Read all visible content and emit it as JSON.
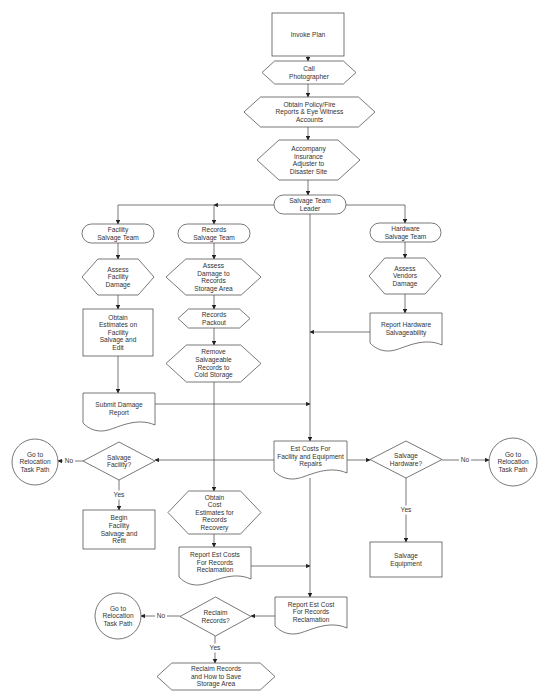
{
  "colors": {
    "stroke": "#555555",
    "fill": "#ffffff",
    "text": "#333333",
    "background": "#ffffff"
  },
  "nodes": [
    {
      "id": "invoke-plan",
      "shape": "rect",
      "x": 272,
      "y": 13,
      "w": 72,
      "h": 43,
      "lines": [
        "Invoke Plan"
      ]
    },
    {
      "id": "call-photographer",
      "shape": "hexagon",
      "x": 262,
      "y": 61,
      "w": 94,
      "h": 23,
      "lines": [
        "Call",
        "Photographer"
      ]
    },
    {
      "id": "obtain-policy",
      "shape": "hexagon",
      "x": 244,
      "y": 97,
      "w": 131,
      "h": 30,
      "lines": [
        "Obtain Policy/Fire",
        "Reports & Eye Witness",
        "Accounts"
      ]
    },
    {
      "id": "accompany-adjuster",
      "shape": "hexagon",
      "x": 257,
      "y": 140,
      "w": 103,
      "h": 40,
      "lines": [
        "Accompany",
        "Insurance",
        "Adjuster to",
        "Disaster Site"
      ]
    },
    {
      "id": "salvage-team-leader",
      "shape": "terminator",
      "x": 274,
      "y": 195,
      "w": 72,
      "h": 19,
      "lines": [
        "Salvage Team",
        "Leader"
      ]
    },
    {
      "id": "facility-salvage-team",
      "shape": "terminator",
      "x": 82,
      "y": 224,
      "w": 72,
      "h": 19,
      "lines": [
        "Facility",
        "Salvage Team"
      ]
    },
    {
      "id": "assess-facility-damage",
      "shape": "hexagon",
      "x": 82,
      "y": 259,
      "w": 72,
      "h": 36,
      "lines": [
        "Assess",
        "Facility",
        "Damage"
      ]
    },
    {
      "id": "obtain-estimates-facility",
      "shape": "rect",
      "x": 83,
      "y": 309,
      "w": 70,
      "h": 47,
      "lines": [
        "Obtain",
        "Estimates on",
        "Facility",
        "Salvage and",
        "Edit"
      ]
    },
    {
      "id": "submit-damage-report",
      "shape": "document",
      "x": 83,
      "y": 393,
      "w": 72,
      "h": 37,
      "lines": [
        "Submit Damage",
        "Report"
      ]
    },
    {
      "id": "records-salvage-team",
      "shape": "terminator",
      "x": 178,
      "y": 224,
      "w": 72,
      "h": 19,
      "lines": [
        "Records",
        "Salvage Team"
      ]
    },
    {
      "id": "assess-records-damage",
      "shape": "hexagon",
      "x": 166,
      "y": 259,
      "w": 95,
      "h": 36,
      "lines": [
        "Assess",
        "Damage to",
        "Records",
        "Storage Area"
      ]
    },
    {
      "id": "records-packout",
      "shape": "hexagon",
      "x": 178,
      "y": 309,
      "w": 72,
      "h": 19,
      "lines": [
        "Records",
        "Packout"
      ]
    },
    {
      "id": "remove-salvageable",
      "shape": "hexagon",
      "x": 166,
      "y": 345,
      "w": 95,
      "h": 37,
      "lines": [
        "Remove",
        "Salvageable",
        "Records to",
        "Cold Storage"
      ]
    },
    {
      "id": "hardware-salvage-team",
      "shape": "terminator",
      "x": 370,
      "y": 223,
      "w": 71,
      "h": 19,
      "lines": [
        "Hardware",
        "Salvage Team"
      ]
    },
    {
      "id": "assess-vendors-damage",
      "shape": "hexagon",
      "x": 369,
      "y": 258,
      "w": 72,
      "h": 36,
      "lines": [
        "Assess",
        "Vendors",
        "Damage"
      ]
    },
    {
      "id": "report-hardware",
      "shape": "document",
      "x": 370,
      "y": 313,
      "w": 72,
      "h": 37,
      "lines": [
        "Report Hardware",
        "Salvageability"
      ]
    },
    {
      "id": "est-costs-facility",
      "shape": "document",
      "x": 274,
      "y": 441,
      "w": 73,
      "h": 37,
      "lines": [
        "Est Costs For",
        "Facility and Equipment",
        "Repairs"
      ]
    },
    {
      "id": "salvage-facility-decision",
      "shape": "diamond",
      "x": 83,
      "y": 442,
      "w": 72,
      "h": 38,
      "lines": [
        "Salvage",
        "Facility?"
      ]
    },
    {
      "id": "relocation-left",
      "shape": "circle",
      "x": 12,
      "y": 439,
      "w": 46,
      "h": 46,
      "lines": [
        "Go to",
        "Relocation",
        "Task Path"
      ]
    },
    {
      "id": "begin-facility-salvage",
      "shape": "rect",
      "x": 83,
      "y": 510,
      "w": 72,
      "h": 39,
      "lines": [
        "Begin",
        "Facility",
        "Salvage and",
        "Refit"
      ]
    },
    {
      "id": "salvage-hardware-decision",
      "shape": "diamond",
      "x": 370,
      "y": 441,
      "w": 72,
      "h": 37,
      "lines": [
        "Salvage",
        "Hardware?"
      ]
    },
    {
      "id": "relocation-right",
      "shape": "circle",
      "x": 489,
      "y": 438,
      "w": 48,
      "h": 48,
      "lines": [
        "Go to",
        "Relocation",
        "Task Path"
      ]
    },
    {
      "id": "salvage-equipment",
      "shape": "rect",
      "x": 370,
      "y": 542,
      "w": 72,
      "h": 35,
      "lines": [
        "Salvage",
        "Equipment"
      ]
    },
    {
      "id": "obtain-cost-records",
      "shape": "hexagon",
      "x": 168,
      "y": 491,
      "w": 93,
      "h": 43,
      "lines": [
        "Obtain",
        "Cost",
        "Estimates for",
        "Records",
        "Recovery"
      ]
    },
    {
      "id": "report-est-costs-records",
      "shape": "document",
      "x": 179,
      "y": 547,
      "w": 72,
      "h": 37,
      "lines": [
        "Report Est Costs",
        "For Records",
        "Reclamation"
      ]
    },
    {
      "id": "report-est-cost-final",
      "shape": "document",
      "x": 275,
      "y": 597,
      "w": 72,
      "h": 36,
      "lines": [
        "Report Est Cost",
        "For Records",
        "Reclamation"
      ]
    },
    {
      "id": "reclaim-records-decision",
      "shape": "diamond",
      "x": 180,
      "y": 597,
      "w": 71,
      "h": 39,
      "lines": [
        "Reclaim",
        "Records?"
      ]
    },
    {
      "id": "relocation-bottom",
      "shape": "circle",
      "x": 95,
      "y": 593,
      "w": 46,
      "h": 46,
      "lines": [
        "Go to",
        "Relocation",
        "Task Path"
      ]
    },
    {
      "id": "reclaim-records-save",
      "shape": "hexagon",
      "x": 157,
      "y": 663,
      "w": 118,
      "h": 27,
      "lines": [
        "Reclaim Records",
        "and How to Save",
        "Storage Area"
      ]
    }
  ],
  "edges": [
    {
      "id": "e1",
      "points": [
        [
          308,
          56
        ],
        [
          308,
          61
        ]
      ],
      "arrow": true
    },
    {
      "id": "e2",
      "points": [
        [
          308,
          84
        ],
        [
          308,
          97
        ]
      ],
      "arrow": true
    },
    {
      "id": "e3",
      "points": [
        [
          308,
          127
        ],
        [
          308,
          140
        ]
      ],
      "arrow": true
    },
    {
      "id": "e4",
      "points": [
        [
          308,
          180
        ],
        [
          308,
          195
        ]
      ],
      "arrow": true
    },
    {
      "id": "e5",
      "points": [
        [
          274,
          205
        ],
        [
          214,
          205
        ]
      ],
      "arrow": true
    },
    {
      "id": "e6",
      "points": [
        [
          214,
          205
        ],
        [
          118,
          205
        ],
        [
          118,
          224
        ]
      ],
      "arrow": true
    },
    {
      "id": "e7",
      "points": [
        [
          214,
          205
        ],
        [
          214,
          224
        ]
      ],
      "arrow": true
    },
    {
      "id": "e8",
      "points": [
        [
          346,
          205
        ],
        [
          405,
          205
        ],
        [
          405,
          223
        ]
      ],
      "arrow": true
    },
    {
      "id": "e9",
      "points": [
        [
          118,
          243
        ],
        [
          118,
          259
        ]
      ],
      "arrow": true
    },
    {
      "id": "e10",
      "points": [
        [
          118,
          295
        ],
        [
          118,
          309
        ]
      ],
      "arrow": true
    },
    {
      "id": "e11",
      "points": [
        [
          118,
          356
        ],
        [
          118,
          393
        ]
      ],
      "arrow": true
    },
    {
      "id": "e12",
      "points": [
        [
          214,
          243
        ],
        [
          214,
          259
        ]
      ],
      "arrow": true
    },
    {
      "id": "e13",
      "points": [
        [
          214,
          295
        ],
        [
          214,
          309
        ]
      ],
      "arrow": true
    },
    {
      "id": "e14",
      "points": [
        [
          214,
          328
        ],
        [
          214,
          345
        ]
      ],
      "arrow": true
    },
    {
      "id": "e15",
      "points": [
        [
          214,
          382
        ],
        [
          214,
          491
        ]
      ],
      "arrow": true
    },
    {
      "id": "e16",
      "points": [
        [
          405,
          242
        ],
        [
          405,
          258
        ]
      ],
      "arrow": true
    },
    {
      "id": "e17",
      "points": [
        [
          405,
          294
        ],
        [
          405,
          313
        ]
      ],
      "arrow": true
    },
    {
      "id": "e18",
      "points": [
        [
          370,
          332
        ],
        [
          310,
          332
        ]
      ],
      "arrow": true
    },
    {
      "id": "e19",
      "points": [
        [
          310,
          214
        ],
        [
          310,
          441
        ]
      ],
      "arrow": true
    },
    {
      "id": "e20",
      "points": [
        [
          155,
          404
        ],
        [
          310,
          404
        ]
      ],
      "arrow": true
    },
    {
      "id": "e21",
      "points": [
        [
          274,
          460
        ],
        [
          155,
          460
        ]
      ],
      "arrow": true
    },
    {
      "id": "e22",
      "points": [
        [
          83,
          461
        ],
        [
          58,
          461
        ]
      ],
      "arrow": true,
      "label": "No",
      "lx": 69,
      "ly": 461
    },
    {
      "id": "e23",
      "points": [
        [
          119,
          480
        ],
        [
          119,
          510
        ]
      ],
      "arrow": true,
      "label": "Yes",
      "lx": 119,
      "ly": 495
    },
    {
      "id": "e24",
      "points": [
        [
          347,
          460
        ],
        [
          370,
          460
        ]
      ],
      "arrow": true
    },
    {
      "id": "e25",
      "points": [
        [
          442,
          460
        ],
        [
          489,
          460
        ]
      ],
      "arrow": true,
      "label": "No",
      "lx": 465,
      "ly": 460
    },
    {
      "id": "e26",
      "points": [
        [
          406,
          478
        ],
        [
          406,
          542
        ]
      ],
      "arrow": true,
      "label": "Yes",
      "lx": 406,
      "ly": 510
    },
    {
      "id": "e27",
      "points": [
        [
          310,
          478
        ],
        [
          310,
          597
        ]
      ],
      "arrow": true
    },
    {
      "id": "e28",
      "points": [
        [
          214,
          534
        ],
        [
          214,
          547
        ]
      ],
      "arrow": true
    },
    {
      "id": "e29",
      "points": [
        [
          251,
          566
        ],
        [
          310,
          566
        ]
      ],
      "arrow": true
    },
    {
      "id": "e30",
      "points": [
        [
          275,
          616
        ],
        [
          251,
          616
        ]
      ],
      "arrow": true
    },
    {
      "id": "e31",
      "points": [
        [
          180,
          616
        ],
        [
          141,
          616
        ]
      ],
      "arrow": true,
      "label": "No",
      "lx": 161,
      "ly": 616
    },
    {
      "id": "e32",
      "points": [
        [
          215,
          636
        ],
        [
          215,
          663
        ]
      ],
      "arrow": true,
      "label": "Yes",
      "lx": 215,
      "ly": 648
    }
  ]
}
